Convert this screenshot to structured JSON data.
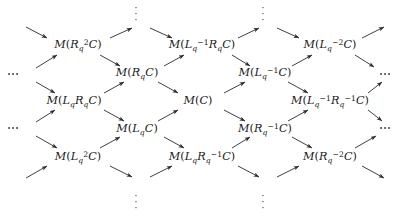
{
  "diagram": {
    "type": "lattice-quiver",
    "width": 400,
    "height": 218,
    "arrow_color": "#2a2a2a",
    "text_color": "#1a1a1a",
    "nodes": [
      {
        "id": "n-r2c",
        "row": 0,
        "x": 78,
        "y": 45,
        "label": "M(R_q^2 C)",
        "html": "M<span class=\"paren\">(</span>R<sub>q</sub><sup>2</sup>C<span class=\"paren\">)</span>"
      },
      {
        "id": "n-lm1rc",
        "row": 0,
        "x": 202,
        "y": 45,
        "label": "M(L_q^{-1} R_q C)",
        "html": "M<span class=\"paren\">(</span>L<sub>q</sub><sup>&minus;1</sup>R<sub>q</sub>C<span class=\"paren\">)</span>"
      },
      {
        "id": "n-lm2c",
        "row": 0,
        "x": 330,
        "y": 45,
        "label": "M(L_q^{-2} C)",
        "html": "M<span class=\"paren\">(</span>L<sub>q</sub><sup>&minus;2</sup>C<span class=\"paren\">)</span>"
      },
      {
        "id": "n-rc",
        "row": 1,
        "x": 137,
        "y": 73,
        "label": "M(R_q C)",
        "html": "M<span class=\"paren\">(</span>R<sub>q</sub>C<span class=\"paren\">)</span>"
      },
      {
        "id": "n-lm1c",
        "row": 1,
        "x": 265,
        "y": 73,
        "label": "M(L_q^{-1} C)",
        "html": "M<span class=\"paren\">(</span>L<sub>q</sub><sup>&minus;1</sup>C<span class=\"paren\">)</span>"
      },
      {
        "id": "n-lrc",
        "row": 2,
        "x": 74,
        "y": 101,
        "label": "M(L_q R_q C)",
        "html": "M<span class=\"paren\">(</span>L<sub>q</sub>R<sub>q</sub>C<span class=\"paren\">)</span>"
      },
      {
        "id": "n-c",
        "row": 2,
        "x": 198,
        "y": 101,
        "label": "M(C)",
        "html": "M<span class=\"paren\">(</span>C<span class=\"paren\">)</span>"
      },
      {
        "id": "n-lm1rm1c",
        "row": 2,
        "x": 330,
        "y": 101,
        "label": "M(L_q^{-1} R_q^{-1} C)",
        "html": "M<span class=\"paren\">(</span>L<sub>q</sub><sup>&minus;1</sup>R<sub>q</sub><sup>&minus;1</sup>C<span class=\"paren\">)</span>"
      },
      {
        "id": "n-lc",
        "row": 3,
        "x": 137,
        "y": 129,
        "label": "M(L_q C)",
        "html": "M<span class=\"paren\">(</span>L<sub>q</sub>C<span class=\"paren\">)</span>"
      },
      {
        "id": "n-rm1c",
        "row": 3,
        "x": 265,
        "y": 129,
        "label": "M(R_q^{-1} C)",
        "html": "M<span class=\"paren\">(</span>R<sub>q</sub><sup>&minus;1</sup>C<span class=\"paren\">)</span>"
      },
      {
        "id": "n-l2c",
        "row": 4,
        "x": 78,
        "y": 157,
        "label": "M(L_q^2 C)",
        "html": "M<span class=\"paren\">(</span>L<sub>q</sub><sup>2</sup>C<span class=\"paren\">)</span>"
      },
      {
        "id": "n-lrm1c",
        "row": 4,
        "x": 202,
        "y": 157,
        "label": "M(L_q R_q^{-1} C)",
        "html": "M<span class=\"paren\">(</span>L<sub>q</sub>R<sub>q</sub><sup>&minus;1</sup>C<span class=\"paren\">)</span>"
      },
      {
        "id": "n-rm2c",
        "row": 4,
        "x": 330,
        "y": 157,
        "label": "M(R_q^{-2} C)",
        "html": "M<span class=\"paren\">(</span>R<sub>q</sub><sup>&minus;2</sup>C<span class=\"paren\">)</span>"
      }
    ],
    "vertical_ellipses": [
      {
        "id": "vdots-top-left",
        "x": 136,
        "y": 14,
        "glyph": "vertical-dots"
      },
      {
        "id": "vdots-top-right",
        "x": 263,
        "y": 14,
        "glyph": "vertical-dots"
      },
      {
        "id": "vdots-bottom-left",
        "x": 136,
        "y": 202,
        "glyph": "vertical-dots"
      },
      {
        "id": "vdots-bottom-right",
        "x": 263,
        "y": 202,
        "glyph": "vertical-dots"
      }
    ],
    "horizontal_ellipses": [
      {
        "id": "hdots-left-upper",
        "x": 14,
        "y": 74,
        "glyph": "horizontal-dots",
        "text": "⋯"
      },
      {
        "id": "hdots-left-lower",
        "x": 14,
        "y": 128,
        "glyph": "horizontal-dots",
        "text": "⋯"
      },
      {
        "id": "hdots-right-upper",
        "x": 386,
        "y": 74,
        "glyph": "horizontal-dots",
        "text": "⋯"
      },
      {
        "id": "hdots-right-lower",
        "x": 386,
        "y": 128,
        "glyph": "horizontal-dots",
        "text": "⋯"
      }
    ],
    "arrows": [
      {
        "id": "a01",
        "from": "hdots-top-in-1",
        "to": "n-r2c",
        "x1": 26,
        "y1": 27,
        "x2": 47,
        "y2": 38
      },
      {
        "id": "a02",
        "from": "n-r2c",
        "to": "vdots-tl",
        "x1": 110,
        "y1": 38,
        "x2": 132,
        "y2": 28
      },
      {
        "id": "a03",
        "from": "vdots-tl",
        "to": "n-lm1rc",
        "x1": 150,
        "y1": 28,
        "x2": 172,
        "y2": 38
      },
      {
        "id": "a04",
        "from": "n-lm1rc",
        "to": "vdots-tr",
        "x1": 238,
        "y1": 38,
        "x2": 259,
        "y2": 28
      },
      {
        "id": "a05",
        "from": "vdots-tr",
        "to": "n-lm2c",
        "x1": 277,
        "y1": 28,
        "x2": 299,
        "y2": 38
      },
      {
        "id": "a06",
        "from": "n-lm2c",
        "to": "out-top-r",
        "x1": 362,
        "y1": 38,
        "x2": 384,
        "y2": 27
      },
      {
        "id": "a07",
        "from": "hdots-left-upper",
        "to": "n-r2c",
        "x1": 36,
        "y1": 68,
        "x2": 57,
        "y2": 55
      },
      {
        "id": "a08",
        "from": "n-r2c",
        "to": "n-rc",
        "x1": 100,
        "y1": 55,
        "x2": 120,
        "y2": 66
      },
      {
        "id": "a09",
        "from": "n-rc",
        "to": "n-lm1rc",
        "x1": 164,
        "y1": 66,
        "x2": 184,
        "y2": 55
      },
      {
        "id": "a10",
        "from": "n-lm1rc",
        "to": "n-lm1c",
        "x1": 232,
        "y1": 55,
        "x2": 250,
        "y2": 66
      },
      {
        "id": "a11",
        "from": "n-lm1c",
        "to": "n-lm2c",
        "x1": 292,
        "y1": 66,
        "x2": 312,
        "y2": 55
      },
      {
        "id": "a12",
        "from": "n-lm2c",
        "to": "hdots-ru",
        "x1": 355,
        "y1": 55,
        "x2": 374,
        "y2": 67
      },
      {
        "id": "a13",
        "from": "hdots-left-upper",
        "to": "n-lrc",
        "x1": 36,
        "y1": 82,
        "x2": 55,
        "y2": 93
      },
      {
        "id": "a14",
        "from": "n-lrc",
        "to": "n-rc",
        "x1": 104,
        "y1": 93,
        "x2": 124,
        "y2": 82
      },
      {
        "id": "a15",
        "from": "n-rc",
        "to": "n-c",
        "x1": 158,
        "y1": 82,
        "x2": 178,
        "y2": 93
      },
      {
        "id": "a16",
        "from": "n-c",
        "to": "n-lm1c",
        "x1": 224,
        "y1": 93,
        "x2": 245,
        "y2": 82
      },
      {
        "id": "a17",
        "from": "n-lm1c",
        "to": "n-lm1rm1c",
        "x1": 288,
        "y1": 82,
        "x2": 308,
        "y2": 93
      },
      {
        "id": "a18",
        "from": "n-lm1rm1c",
        "to": "hdots-ru",
        "x1": 368,
        "y1": 93,
        "x2": 382,
        "y2": 82
      },
      {
        "id": "a19",
        "from": "hdots-left-lower",
        "to": "n-lrc",
        "x1": 36,
        "y1": 122,
        "x2": 55,
        "y2": 110
      },
      {
        "id": "a20",
        "from": "n-lrc",
        "to": "n-lc",
        "x1": 104,
        "y1": 110,
        "x2": 124,
        "y2": 121
      },
      {
        "id": "a21",
        "from": "n-lc",
        "to": "n-c",
        "x1": 158,
        "y1": 121,
        "x2": 178,
        "y2": 110
      },
      {
        "id": "a22",
        "from": "n-c",
        "to": "n-rm1c",
        "x1": 224,
        "y1": 110,
        "x2": 245,
        "y2": 121
      },
      {
        "id": "a23",
        "from": "n-rm1c",
        "to": "n-lm1rm1c",
        "x1": 288,
        "y1": 121,
        "x2": 308,
        "y2": 110
      },
      {
        "id": "a24",
        "from": "n-lm1rm1c",
        "to": "hdots-rl",
        "x1": 368,
        "y1": 110,
        "x2": 382,
        "y2": 121
      },
      {
        "id": "a25",
        "from": "hdots-left-lower",
        "to": "n-l2c",
        "x1": 36,
        "y1": 136,
        "x2": 57,
        "y2": 148
      },
      {
        "id": "a26",
        "from": "n-l2c",
        "to": "n-lc",
        "x1": 100,
        "y1": 148,
        "x2": 120,
        "y2": 137
      },
      {
        "id": "a27",
        "from": "n-lc",
        "to": "n-lrm1c",
        "x1": 164,
        "y1": 137,
        "x2": 184,
        "y2": 148
      },
      {
        "id": "a28",
        "from": "n-lrm1c",
        "to": "n-rm1c",
        "x1": 232,
        "y1": 148,
        "x2": 250,
        "y2": 137
      },
      {
        "id": "a29",
        "from": "n-rm1c",
        "to": "n-rm2c",
        "x1": 292,
        "y1": 137,
        "x2": 312,
        "y2": 148
      },
      {
        "id": "a30",
        "from": "n-rm2c",
        "to": "hdots-rl",
        "x1": 355,
        "y1": 148,
        "x2": 376,
        "y2": 136
      },
      {
        "id": "a31",
        "from": "in-bot-l",
        "to": "n-l2c",
        "x1": 26,
        "y1": 178,
        "x2": 47,
        "y2": 166
      },
      {
        "id": "a32",
        "from": "n-l2c",
        "to": "vdots-bl",
        "x1": 110,
        "y1": 166,
        "x2": 132,
        "y2": 177
      },
      {
        "id": "a33",
        "from": "vdots-bl",
        "to": "n-lrm1c",
        "x1": 150,
        "y1": 177,
        "x2": 172,
        "y2": 166
      },
      {
        "id": "a34",
        "from": "n-lrm1c",
        "to": "vdots-br",
        "x1": 238,
        "y1": 166,
        "x2": 259,
        "y2": 177
      },
      {
        "id": "a35",
        "from": "vdots-br",
        "to": "n-rm2c",
        "x1": 277,
        "y1": 177,
        "x2": 299,
        "y2": 166
      },
      {
        "id": "a36",
        "from": "n-rm2c",
        "to": "out-bot-r",
        "x1": 362,
        "y1": 166,
        "x2": 384,
        "y2": 178
      }
    ]
  }
}
